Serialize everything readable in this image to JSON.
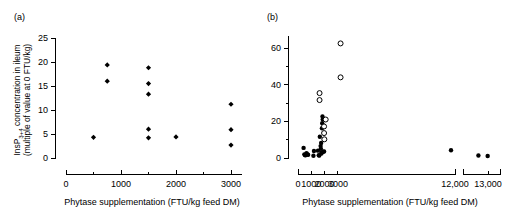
{
  "figure": {
    "panels": [
      {
        "label": "(a)",
        "xlabel": "Phytase supplementation (FTU/kg feed DM)",
        "ylabel_line1": "InsP",
        "ylabel_sub": "3+4",
        "ylabel_line1b": " concentration in ileum",
        "ylabel_line2": "(multiple of value at 0 FTU/kg)"
      },
      {
        "label": "(b)",
        "xlabel": "Phytase supplementation (FTU/kg feed DM)"
      }
    ]
  },
  "chart_data": [
    {
      "type": "scatter",
      "panel": "(a)",
      "title": "",
      "xlabel": "Phytase supplementation (FTU/kg feed DM)",
      "ylabel": "InsP3+4 concentration in ileum (multiple of value at 0 FTU/kg)",
      "xlim": [
        0,
        3200
      ],
      "ylim": [
        0,
        25
      ],
      "xticks": [
        0,
        1000,
        2000,
        3000
      ],
      "xtick_labels": [
        "0",
        "1000",
        "2000",
        "3000"
      ],
      "xminor_ticks": [
        500,
        1500,
        2500
      ],
      "yticks": [
        0,
        5,
        10,
        15,
        20,
        25
      ],
      "ytick_labels": [
        "0",
        "5",
        "10",
        "15",
        "20",
        "25"
      ],
      "grid": false,
      "legend": "none",
      "axis_broken": false,
      "series": [
        {
          "name": "ileum InsP3+4",
          "marker": "filled-diamond",
          "color": "#000000",
          "points": [
            {
              "x": 500,
              "y": 4.3
            },
            {
              "x": 750,
              "y": 19.4
            },
            {
              "x": 750,
              "y": 16.0
            },
            {
              "x": 1500,
              "y": 18.8
            },
            {
              "x": 1500,
              "y": 15.5
            },
            {
              "x": 1500,
              "y": 13.3
            },
            {
              "x": 1500,
              "y": 6.0
            },
            {
              "x": 1500,
              "y": 4.2
            },
            {
              "x": 2000,
              "y": 4.4
            },
            {
              "x": 3000,
              "y": 11.2
            },
            {
              "x": 3000,
              "y": 5.9
            },
            {
              "x": 3000,
              "y": 2.7
            }
          ]
        }
      ]
    },
    {
      "type": "scatter",
      "panel": "(b)",
      "title": "",
      "xlabel": "Phytase supplementation (FTU/kg feed DM)",
      "ylabel": "",
      "ylim": [
        0,
        68
      ],
      "yticks": [
        0,
        20,
        40,
        60
      ],
      "ytick_labels": [
        "0",
        "20",
        "40",
        "60"
      ],
      "yminor_ticks": [
        10,
        30,
        50
      ],
      "grid": false,
      "legend": "none",
      "axis_broken": true,
      "xaxis_segments": [
        {
          "range": [
            0,
            11800
          ],
          "ticks": [
            0,
            1000,
            2000,
            3000
          ],
          "labels": [
            "0",
            "1000",
            "2000",
            "3000"
          ],
          "end_label": "12,000"
        },
        {
          "range": [
            12000,
            13200
          ],
          "ticks": [
            13000
          ],
          "labels": [
            "13,000"
          ]
        }
      ],
      "xticks_all": [
        0,
        1000,
        2000,
        3000,
        12000,
        13000
      ],
      "xtick_labels_all": [
        "0",
        "1000",
        "2000",
        "3000",
        "12,000",
        "13,000"
      ],
      "series": [
        {
          "name": "filled markers",
          "marker": "filled-circle",
          "color": "#000000",
          "points": [
            {
              "x": 420,
              "y": 5.5
            },
            {
              "x": 480,
              "y": 2.0
            },
            {
              "x": 520,
              "y": 1.6
            },
            {
              "x": 560,
              "y": 1.5
            },
            {
              "x": 640,
              "y": 2.6
            },
            {
              "x": 700,
              "y": 1.9
            },
            {
              "x": 760,
              "y": 1.8
            },
            {
              "x": 1160,
              "y": 1.2
            },
            {
              "x": 1200,
              "y": 3.8
            },
            {
              "x": 1500,
              "y": 4.0
            },
            {
              "x": 1560,
              "y": 1.5
            },
            {
              "x": 1600,
              "y": 1.3
            },
            {
              "x": 1640,
              "y": 11.6
            },
            {
              "x": 1700,
              "y": 6.5
            },
            {
              "x": 1720,
              "y": 5.0
            },
            {
              "x": 1740,
              "y": 8.2
            },
            {
              "x": 1760,
              "y": 2.4
            },
            {
              "x": 1780,
              "y": 3.0
            },
            {
              "x": 1800,
              "y": 16.2
            },
            {
              "x": 1820,
              "y": 19.0
            },
            {
              "x": 1840,
              "y": 22.6
            },
            {
              "x": 1860,
              "y": 21.0
            },
            {
              "x": 1900,
              "y": 3.4
            },
            {
              "x": 1960,
              "y": 3.6
            },
            {
              "x": 11500,
              "y": 4.2
            },
            {
              "x": 12500,
              "y": 1.4
            },
            {
              "x": 12800,
              "y": 1.1
            }
          ]
        },
        {
          "name": "open markers",
          "marker": "open-circle",
          "color": "#000000",
          "points": [
            {
              "x": 1620,
              "y": 35.4
            },
            {
              "x": 1620,
              "y": 31.6
            },
            {
              "x": 1960,
              "y": 17.2
            },
            {
              "x": 1960,
              "y": 13.6
            },
            {
              "x": 1980,
              "y": 10.2
            },
            {
              "x": 2080,
              "y": 21.0
            },
            {
              "x": 3200,
              "y": 62.5
            },
            {
              "x": 3200,
              "y": 44.0
            }
          ]
        }
      ]
    }
  ]
}
